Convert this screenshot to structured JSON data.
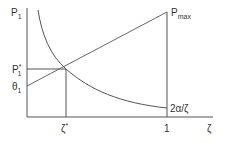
{
  "diagram": {
    "y_axis_label": "P",
    "y_axis_sub": "1",
    "p_max_label": "P",
    "p_max_sub": "max",
    "p_star_label": "P",
    "p_star_sup": "*",
    "p_star_sub": "1",
    "theta_label": "θ",
    "theta_sub": "1",
    "zeta_star_label": "ζ",
    "zeta_star_sup": "*",
    "one_label": "1",
    "x_axis_label": "ζ",
    "curve_label": "2α/ζ"
  },
  "colors": {
    "line": "#555555",
    "text": "#333333"
  }
}
